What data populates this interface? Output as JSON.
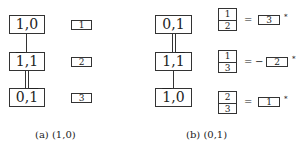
{
  "panel_a": {
    "caption": "(a) (1,0)",
    "nodes": [
      {
        "pre": "1,0",
        "over": "",
        "post": ""
      },
      {
        "pre": "",
        "over": "1",
        "post": ",1"
      },
      {
        "pre": "0,",
        "over": "1",
        "post": ""
      }
    ],
    "edges": [
      "single",
      "double"
    ],
    "labels": [
      "1",
      "2",
      "3"
    ]
  },
  "panel_b": {
    "caption": "(b) (0,1)",
    "nodes": [
      {
        "pre": "0,1",
        "over": "",
        "post": ""
      },
      {
        "pre": "1,",
        "over": "1",
        "post": ""
      },
      {
        "pre": "",
        "over": "1",
        "post": ",0"
      }
    ],
    "edges": [
      "double",
      "single"
    ],
    "relations": [
      {
        "top": "1",
        "bottom": "2",
        "equals": "=",
        "sign": "",
        "value": "3",
        "mark": "*"
      },
      {
        "top": "1",
        "bottom": "3",
        "equals": "=",
        "sign": "−",
        "value": "2",
        "mark": "*"
      },
      {
        "top": "2",
        "bottom": "3",
        "equals": "=",
        "sign": "",
        "value": "1",
        "mark": "*"
      }
    ]
  }
}
